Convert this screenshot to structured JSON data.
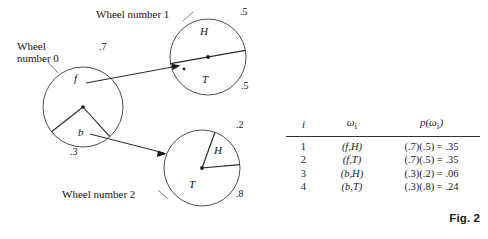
{
  "figure": {
    "label": "Fig. 2",
    "wheels": [
      {
        "caption_line1": "Wheel",
        "caption_line2": "number 0",
        "caption": "Wheel number 0",
        "cx": 83,
        "cy": 107,
        "r": 40,
        "sectors": [
          {
            "letter": "f",
            "probability": ".7",
            "letter_x": 74,
            "letter_y": 78,
            "prob_x": 99,
            "prob_y": 47
          },
          {
            "letter": "b",
            "probability": ".3",
            "letter_x": 78,
            "letter_y": 132,
            "prob_x": 72,
            "prob_y": 151
          }
        ],
        "radii_degrees": [
          218,
          312
        ]
      },
      {
        "caption_line1": "Wheel number 1",
        "caption_line2": "",
        "caption": "Wheel number 1",
        "cx": 208,
        "cy": 57,
        "r": 38,
        "sectors": [
          {
            "letter": "H",
            "probability": ".5",
            "letter_x": 201,
            "letter_y": 31,
            "prob_x": 240,
            "prob_y": 11
          },
          {
            "letter": "T",
            "probability": ".5",
            "letter_x": 203,
            "letter_y": 79,
            "prob_x": 241,
            "prob_y": 85
          }
        ],
        "radii_degrees": [
          170,
          350
        ]
      },
      {
        "caption_line1": "Wheel number 2",
        "caption_line2": "",
        "caption": "Wheel number 2",
        "cx": 202,
        "cy": 168,
        "r": 38,
        "sectors": [
          {
            "letter": "H",
            "probability": ".2",
            "letter_x": 215,
            "letter_y": 150,
            "prob_x": 237,
            "prob_y": 124
          },
          {
            "letter": "T",
            "probability": ".8",
            "letter_x": 190,
            "letter_y": 184,
            "prob_x": 237,
            "prob_y": 193
          }
        ],
        "radii_degrees": [
          290,
          355
        ]
      }
    ]
  },
  "table": {
    "headers": [
      "i",
      "ω",
      "p(ω"
    ],
    "header_i": "i",
    "header_omega": "ω",
    "header_omega_sub": "i",
    "header_p_open": "p(ω",
    "header_p_sub": "i",
    "header_p_close": ")",
    "rows": [
      {
        "i": "1",
        "omega": "(f,H)",
        "p": "(.7)(.5) = .35"
      },
      {
        "i": "2",
        "omega": "(f,T)",
        "p": "(.7)(.5) = .35"
      },
      {
        "i": "3",
        "omega": "(b,H)",
        "p": "(.3)(.2) = .06"
      },
      {
        "i": "4",
        "omega": "(b,T)",
        "p": "(.3)(.8) = .24"
      }
    ]
  },
  "colors": {
    "ink": "#141414",
    "stroke": "#3a3a3a",
    "background": "#ffffff"
  }
}
